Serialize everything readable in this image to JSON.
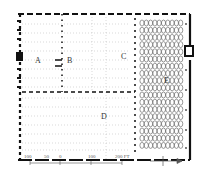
{
  "plan": {
    "rooms": [
      {
        "id": "A",
        "label": "A"
      },
      {
        "id": "B",
        "label": "B"
      },
      {
        "id": "C",
        "label": "C"
      },
      {
        "id": "D",
        "label": "D"
      },
      {
        "id": "E",
        "label": "E"
      }
    ],
    "colors": {
      "wall": "#111111",
      "grid": "#9a9a9a",
      "columns": "#777777",
      "background": "#ffffff"
    }
  },
  "scale_bar": {
    "labels": [
      "100",
      "50",
      "0",
      "100",
      "200 FT"
    ]
  },
  "north_arrow": {
    "direction": "east"
  }
}
